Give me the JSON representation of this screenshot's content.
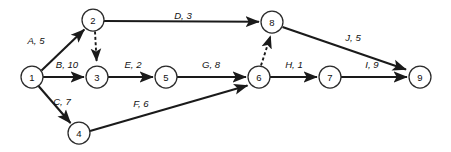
{
  "diagram": {
    "type": "activity-on-arrow-network",
    "title": "",
    "background_color": "#ffffff",
    "line_color": "#1a1a1a",
    "node_fill": "#ffffff",
    "node_stroke": "#2b2b2b",
    "node_radius": 11,
    "nodes": [
      {
        "id": "1",
        "label": "1",
        "x": 32,
        "y": 77
      },
      {
        "id": "2",
        "label": "2",
        "x": 93,
        "y": 20
      },
      {
        "id": "3",
        "label": "3",
        "x": 97,
        "y": 77
      },
      {
        "id": "4",
        "label": "4",
        "x": 79,
        "y": 133
      },
      {
        "id": "5",
        "label": "5",
        "x": 166,
        "y": 77
      },
      {
        "id": "6",
        "label": "6",
        "x": 259,
        "y": 77
      },
      {
        "id": "7",
        "label": "7",
        "x": 330,
        "y": 77
      },
      {
        "id": "8",
        "label": "8",
        "x": 272,
        "y": 22
      },
      {
        "id": "9",
        "label": "9",
        "x": 420,
        "y": 77
      }
    ],
    "edges": [
      {
        "id": "A",
        "from": "1",
        "to": "2",
        "activity": "A",
        "duration": 5,
        "label": "A, 5",
        "label_x": 36,
        "label_y": 40,
        "style": "solid"
      },
      {
        "id": "B",
        "from": "1",
        "to": "3",
        "activity": "B",
        "duration": 10,
        "label": "B, 10",
        "label_x": 67,
        "label_y": 64,
        "style": "solid"
      },
      {
        "id": "C",
        "from": "1",
        "to": "4",
        "activity": "C",
        "duration": 7,
        "label": "C, 7",
        "label_x": 62,
        "label_y": 101,
        "style": "solid"
      },
      {
        "id": "D",
        "from": "2",
        "to": "8",
        "activity": "D",
        "duration": 3,
        "label": "D, 3",
        "label_x": 183,
        "label_y": 15,
        "style": "solid"
      },
      {
        "id": "E",
        "from": "3",
        "to": "5",
        "activity": "E",
        "duration": 2,
        "label": "E, 2",
        "label_x": 133,
        "label_y": 64,
        "style": "solid"
      },
      {
        "id": "F",
        "from": "4",
        "to": "6",
        "activity": "F",
        "duration": 6,
        "label": "F, 6",
        "label_x": 141,
        "label_y": 103,
        "style": "solid"
      },
      {
        "id": "G",
        "from": "5",
        "to": "6",
        "activity": "G",
        "duration": 8,
        "label": "G, 8",
        "label_x": 211,
        "label_y": 64,
        "style": "solid"
      },
      {
        "id": "H",
        "from": "6",
        "to": "7",
        "activity": "H",
        "duration": 1,
        "label": "H, 1",
        "label_x": 294,
        "label_y": 64,
        "style": "solid"
      },
      {
        "id": "I",
        "from": "7",
        "to": "9",
        "activity": "I",
        "duration": 9,
        "label": "I, 9",
        "label_x": 372,
        "label_y": 64,
        "style": "solid"
      },
      {
        "id": "J",
        "from": "8",
        "to": "9",
        "activity": "J",
        "duration": 5,
        "label": "J, 5",
        "label_x": 353,
        "label_y": 37,
        "style": "solid"
      },
      {
        "id": "dummy-2-3",
        "from": "2",
        "to": "3",
        "activity": "",
        "duration": null,
        "label": "",
        "label_x": null,
        "label_y": null,
        "style": "dashed"
      },
      {
        "id": "dummy-6-8",
        "from": "6",
        "to": "8",
        "activity": "",
        "duration": null,
        "label": "",
        "label_x": null,
        "label_y": null,
        "style": "dashed"
      }
    ]
  }
}
